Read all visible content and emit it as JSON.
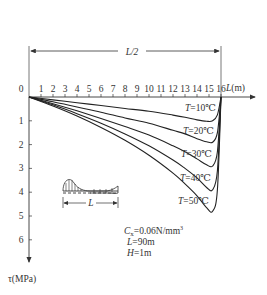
{
  "chart_data": {
    "type": "line",
    "title": "",
    "xlabel": "L(m)",
    "ylabel": "τ(MPa)",
    "x_ticks": [
      "0",
      "1",
      "2",
      "3",
      "4",
      "5",
      "6",
      "7",
      "8",
      "9",
      "10",
      "11",
      "12",
      "13",
      "14",
      "15",
      "16"
    ],
    "y_ticks": [
      "0",
      "1",
      "2",
      "3",
      "4",
      "5",
      "6"
    ],
    "xlim": [
      0,
      16
    ],
    "ylim": [
      0,
      6.5
    ],
    "y_inverted": true,
    "grid": false,
    "span_annotation": "L/2",
    "parameters": [
      "Cx=0.06N/mm³",
      "L=90m",
      "H=1m"
    ],
    "inset_label": "L",
    "x": [
      0,
      2,
      4,
      6,
      8,
      10,
      12,
      13,
      14,
      14.8,
      15.3,
      15.7,
      16
    ],
    "series": [
      {
        "name": "T=10℃",
        "values": [
          0,
          0.12,
          0.24,
          0.36,
          0.48,
          0.6,
          0.76,
          0.85,
          0.96,
          1.02,
          1.0,
          0.75,
          0
        ]
      },
      {
        "name": "T=20℃",
        "values": [
          0,
          0.2,
          0.42,
          0.64,
          0.88,
          1.1,
          1.4,
          1.55,
          1.75,
          1.88,
          1.9,
          1.5,
          0
        ]
      },
      {
        "name": "T=30℃",
        "values": [
          0,
          0.28,
          0.58,
          0.9,
          1.24,
          1.6,
          2.05,
          2.3,
          2.6,
          2.85,
          2.9,
          2.3,
          0
        ]
      },
      {
        "name": "T=40℃",
        "values": [
          0,
          0.33,
          0.7,
          1.1,
          1.55,
          2.05,
          2.65,
          3.0,
          3.4,
          3.8,
          3.9,
          3.1,
          0
        ]
      },
      {
        "name": "T=50℃",
        "values": [
          0,
          0.38,
          0.8,
          1.28,
          1.82,
          2.45,
          3.2,
          3.65,
          4.15,
          4.65,
          4.8,
          3.9,
          0
        ]
      }
    ],
    "series_labels": [
      {
        "T": "T",
        "rest": "=10℃"
      },
      {
        "T": "T",
        "rest": "=20℃"
      },
      {
        "T": "T",
        "rest": "=30℃"
      },
      {
        "T": "T",
        "rest": "=40℃"
      },
      {
        "T": "T",
        "rest": "=50℃"
      }
    ],
    "params": {
      "cx": {
        "sym": "C",
        "sub": "x",
        "val": "=0.06N/mm",
        "sup": "3"
      },
      "L": {
        "sym": "L",
        "val": "=90m"
      },
      "H": {
        "sym": "H",
        "val": "=1m"
      }
    },
    "x_axis_label": {
      "sym": "L",
      "unit": "(m)"
    },
    "y_axis_label": "τ(MPa)",
    "half_label": "L/2"
  }
}
